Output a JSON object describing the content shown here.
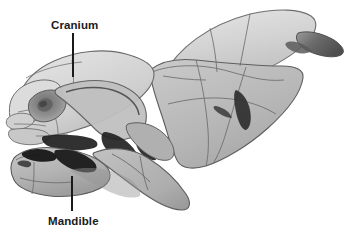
{
  "figure": {
    "background_color": "#ffffff",
    "width": 354,
    "height": 245
  },
  "annotations": [
    {
      "id": "cranium",
      "label": "Cranium",
      "label_x": 51,
      "label_y": 19,
      "leader": {
        "x1": 73,
        "y1": 33,
        "x2": 73,
        "y2": 77
      },
      "color": "#1a1a1a"
    },
    {
      "id": "mandible",
      "label": "Mandible",
      "label_x": 48,
      "label_y": 215,
      "leader": {
        "x1": 72,
        "y1": 176,
        "x2": 72,
        "y2": 211
      },
      "color": "#1a1a1a"
    }
  ],
  "palette": {
    "background": "#ffffff",
    "bone_light": "#dcdcdc",
    "bone_mid": "#b8b8b8",
    "bone_midlight": "#c6c6c6",
    "bone_dark": "#a0a0a0",
    "shadow": "#8c8c8c",
    "cavity_black": "#181818",
    "outline": "#555555",
    "suture": "#6a6a6a",
    "label_text": "#1a1a1a",
    "leader_line": "#1a1a1a"
  },
  "parts": [
    {
      "name": "cranium-dorsal-plate",
      "fill": "#d8d8d8"
    },
    {
      "name": "parietal-region",
      "fill": "#c2c2c2"
    },
    {
      "name": "frontal-region",
      "fill": "#cccccc"
    },
    {
      "name": "nasal-rostrum",
      "fill": "#d4d4d4"
    },
    {
      "name": "orbit-eye-socket",
      "fill": "#9a9a9a"
    },
    {
      "name": "zygomatic-arch",
      "fill": "#bcbcbc"
    },
    {
      "name": "occipital-process",
      "fill": "#6f6f6f"
    },
    {
      "name": "mandible-body",
      "fill": "#bdbdbd"
    },
    {
      "name": "mandibular-ramus",
      "fill": "#b4b4b4"
    },
    {
      "name": "incisor-gap",
      "fill": "#181818"
    },
    {
      "name": "molar-row-shadow",
      "fill": "#1d1d1d"
    },
    {
      "name": "temporal-fossa-shadow",
      "fill": "#2a2a2a"
    }
  ]
}
